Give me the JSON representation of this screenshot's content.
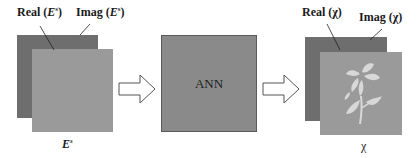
{
  "input": {
    "real_label": "Real (",
    "real_var": "E",
    "real_sup": "s",
    "real_close": ")",
    "imag_label": "Imag (",
    "imag_var": "E",
    "imag_sup": "s",
    "imag_close": ")",
    "caption_var": "E",
    "caption_sup": "s"
  },
  "model": {
    "label": "ANN"
  },
  "output": {
    "real_label": "Real (χ)",
    "imag_label": "Imag (χ)",
    "caption": "χ"
  },
  "colors": {
    "back_layer": "#6e6e6e",
    "front_layer": "#9a9a9a",
    "ann_box": "#8a8a8a",
    "arrow_fill": "#ffffff",
    "arrow_stroke": "#555555",
    "flower": "#d8d8d8"
  }
}
